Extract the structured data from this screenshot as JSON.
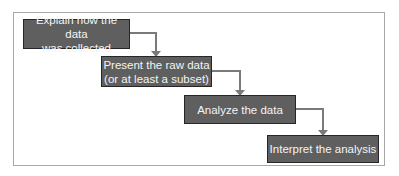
{
  "diagram": {
    "type": "process-flow-staircase",
    "colors": {
      "box_fill": "#5f5f5f",
      "box_border": "#262626",
      "box_text": "#f4f4f4",
      "connector": "#7a7a7a",
      "frame_border": "#a8a8a8"
    },
    "steps": [
      {
        "label": "Explain how the data\nwas collected"
      },
      {
        "label": "Present the raw data\n(or at least a subset)"
      },
      {
        "label": "Analyze the data"
      },
      {
        "label": "Interpret the analysis"
      }
    ]
  }
}
